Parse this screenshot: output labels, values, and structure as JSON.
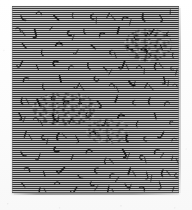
{
  "image": {
    "kind": "halftone-texture-plate",
    "caption": "",
    "title": "",
    "width_px": 192,
    "height_px": 210,
    "background_color": "#ffffff"
  },
  "plate": {
    "label": "textured plate",
    "left_px": 12,
    "top_px": 6,
    "width_px": 167,
    "height_px": 187,
    "base_gray": "#8f8f8f",
    "scanline_dark": "#161616",
    "scanline_light": "#e8e8e8",
    "scanline_period_px": 2,
    "edge_color": "#787878",
    "shadow_color": "#5a5a5a"
  },
  "texture": {
    "description": "mid-gray field of fine horizontal raster scanlines overlaid with scattered short dark curved strokes",
    "mark_color": "#141414",
    "highlight_color": "#f0f0f0",
    "mark_count": 168,
    "clusters": [
      {
        "name": "center-left-dense-cluster",
        "left_px": 20,
        "top_px": 86,
        "width_px": 66,
        "height_px": 34
      },
      {
        "name": "upper-right-dense-cluster",
        "left_px": 112,
        "top_px": 22,
        "width_px": 48,
        "height_px": 34
      },
      {
        "name": "mid-field-cluster",
        "left_px": 74,
        "top_px": 112,
        "width_px": 44,
        "height_px": 26
      }
    ],
    "marks": [
      {
        "x": 9,
        "y": 10,
        "r": -18,
        "s": 1.0,
        "t": "hook"
      },
      {
        "x": 27,
        "y": 8,
        "r": 12,
        "s": 0.9,
        "t": "arc"
      },
      {
        "x": 44,
        "y": 12,
        "r": -40,
        "s": 1.1,
        "t": "tick"
      },
      {
        "x": 61,
        "y": 7,
        "r": 25,
        "s": 0.8,
        "t": "hook"
      },
      {
        "x": 79,
        "y": 11,
        "r": -8,
        "s": 1.0,
        "t": "cee"
      },
      {
        "x": 96,
        "y": 9,
        "r": 35,
        "s": 0.9,
        "t": "tick"
      },
      {
        "x": 113,
        "y": 13,
        "r": -22,
        "s": 1.0,
        "t": "arc"
      },
      {
        "x": 131,
        "y": 8,
        "r": 16,
        "s": 1.1,
        "t": "hook"
      },
      {
        "x": 148,
        "y": 12,
        "r": -30,
        "s": 0.9,
        "t": "jay"
      },
      {
        "x": 158,
        "y": 6,
        "r": 8,
        "s": 0.8,
        "t": "tick"
      },
      {
        "x": 6,
        "y": 24,
        "r": 30,
        "s": 0.9,
        "t": "arc"
      },
      {
        "x": 22,
        "y": 27,
        "r": -14,
        "s": 1.1,
        "t": "jay"
      },
      {
        "x": 39,
        "y": 22,
        "r": 44,
        "s": 0.8,
        "t": "tick"
      },
      {
        "x": 56,
        "y": 28,
        "r": -26,
        "s": 1.0,
        "t": "cee"
      },
      {
        "x": 72,
        "y": 23,
        "r": 10,
        "s": 0.9,
        "t": "hook"
      },
      {
        "x": 90,
        "y": 29,
        "r": -36,
        "s": 1.0,
        "t": "arc"
      },
      {
        "x": 106,
        "y": 24,
        "r": 20,
        "s": 1.1,
        "t": "tick"
      },
      {
        "x": 122,
        "y": 30,
        "r": -12,
        "s": 0.9,
        "t": "hook"
      },
      {
        "x": 139,
        "y": 25,
        "r": 38,
        "s": 1.0,
        "t": "jay"
      },
      {
        "x": 155,
        "y": 29,
        "r": -20,
        "s": 0.9,
        "t": "cee"
      },
      {
        "x": 12,
        "y": 40,
        "r": -34,
        "s": 1.0,
        "t": "tick"
      },
      {
        "x": 30,
        "y": 44,
        "r": 18,
        "s": 0.9,
        "t": "hook"
      },
      {
        "x": 47,
        "y": 39,
        "r": -6,
        "s": 1.1,
        "t": "arc"
      },
      {
        "x": 64,
        "y": 45,
        "r": 28,
        "s": 0.8,
        "t": "jay"
      },
      {
        "x": 81,
        "y": 41,
        "r": -42,
        "s": 1.0,
        "t": "tick"
      },
      {
        "x": 98,
        "y": 46,
        "r": 14,
        "s": 0.9,
        "t": "cee"
      },
      {
        "x": 115,
        "y": 40,
        "r": -24,
        "s": 1.0,
        "t": "hook"
      },
      {
        "x": 132,
        "y": 45,
        "r": 32,
        "s": 1.1,
        "t": "arc"
      },
      {
        "x": 149,
        "y": 41,
        "r": -16,
        "s": 0.9,
        "t": "tick"
      },
      {
        "x": 161,
        "y": 47,
        "r": 22,
        "s": 0.8,
        "t": "hook"
      },
      {
        "x": 8,
        "y": 57,
        "r": 26,
        "s": 1.0,
        "t": "jay"
      },
      {
        "x": 25,
        "y": 61,
        "r": -18,
        "s": 0.9,
        "t": "tick"
      },
      {
        "x": 42,
        "y": 56,
        "r": 40,
        "s": 1.1,
        "t": "cee"
      },
      {
        "x": 59,
        "y": 62,
        "r": -28,
        "s": 0.9,
        "t": "arc"
      },
      {
        "x": 76,
        "y": 57,
        "r": 12,
        "s": 1.0,
        "t": "hook"
      },
      {
        "x": 93,
        "y": 63,
        "r": -38,
        "s": 0.9,
        "t": "tick"
      },
      {
        "x": 110,
        "y": 58,
        "r": 20,
        "s": 1.1,
        "t": "jay"
      },
      {
        "x": 127,
        "y": 62,
        "r": -10,
        "s": 0.9,
        "t": "arc"
      },
      {
        "x": 144,
        "y": 57,
        "r": 34,
        "s": 1.0,
        "t": "hook"
      },
      {
        "x": 159,
        "y": 63,
        "r": -22,
        "s": 0.8,
        "t": "cee"
      },
      {
        "x": 14,
        "y": 74,
        "r": -30,
        "s": 1.0,
        "t": "arc"
      },
      {
        "x": 31,
        "y": 78,
        "r": 16,
        "s": 0.9,
        "t": "hook"
      },
      {
        "x": 48,
        "y": 73,
        "r": -8,
        "s": 1.1,
        "t": "tick"
      },
      {
        "x": 65,
        "y": 79,
        "r": 30,
        "s": 0.9,
        "t": "jay"
      },
      {
        "x": 83,
        "y": 74,
        "r": -44,
        "s": 1.0,
        "t": "cee"
      },
      {
        "x": 100,
        "y": 80,
        "r": 18,
        "s": 0.9,
        "t": "arc"
      },
      {
        "x": 117,
        "y": 75,
        "r": -26,
        "s": 1.1,
        "t": "hook"
      },
      {
        "x": 134,
        "y": 79,
        "r": 36,
        "s": 0.9,
        "t": "tick"
      },
      {
        "x": 151,
        "y": 74,
        "r": -14,
        "s": 1.0,
        "t": "jay"
      },
      {
        "x": 163,
        "y": 80,
        "r": 24,
        "s": 0.8,
        "t": "arc"
      },
      {
        "x": 10,
        "y": 92,
        "r": 22,
        "s": 1.0,
        "t": "hook"
      },
      {
        "x": 26,
        "y": 96,
        "r": -16,
        "s": 1.1,
        "t": "tick"
      },
      {
        "x": 40,
        "y": 91,
        "r": 42,
        "s": 0.9,
        "t": "cee"
      },
      {
        "x": 54,
        "y": 97,
        "r": -30,
        "s": 1.0,
        "t": "arc"
      },
      {
        "x": 68,
        "y": 92,
        "r": 14,
        "s": 0.9,
        "t": "hook"
      },
      {
        "x": 86,
        "y": 98,
        "r": -40,
        "s": 1.0,
        "t": "jay"
      },
      {
        "x": 104,
        "y": 93,
        "r": 26,
        "s": 1.1,
        "t": "tick"
      },
      {
        "x": 121,
        "y": 97,
        "r": -12,
        "s": 0.9,
        "t": "cee"
      },
      {
        "x": 138,
        "y": 92,
        "r": 32,
        "s": 1.0,
        "t": "hook"
      },
      {
        "x": 155,
        "y": 98,
        "r": -24,
        "s": 0.9,
        "t": "arc"
      },
      {
        "x": 7,
        "y": 110,
        "r": -28,
        "s": 1.0,
        "t": "jay"
      },
      {
        "x": 24,
        "y": 114,
        "r": 20,
        "s": 0.9,
        "t": "arc"
      },
      {
        "x": 41,
        "y": 109,
        "r": -6,
        "s": 1.1,
        "t": "hook"
      },
      {
        "x": 58,
        "y": 115,
        "r": 34,
        "s": 0.9,
        "t": "tick"
      },
      {
        "x": 75,
        "y": 110,
        "r": -42,
        "s": 1.0,
        "t": "cee"
      },
      {
        "x": 92,
        "y": 116,
        "r": 16,
        "s": 0.9,
        "t": "jay"
      },
      {
        "x": 109,
        "y": 111,
        "r": -20,
        "s": 1.1,
        "t": "arc"
      },
      {
        "x": 126,
        "y": 115,
        "r": 38,
        "s": 0.9,
        "t": "hook"
      },
      {
        "x": 143,
        "y": 110,
        "r": -10,
        "s": 1.0,
        "t": "tick"
      },
      {
        "x": 158,
        "y": 116,
        "r": 28,
        "s": 0.8,
        "t": "cee"
      },
      {
        "x": 13,
        "y": 128,
        "r": 24,
        "s": 1.0,
        "t": "tick"
      },
      {
        "x": 30,
        "y": 132,
        "r": -18,
        "s": 0.9,
        "t": "cee"
      },
      {
        "x": 47,
        "y": 127,
        "r": 40,
        "s": 1.1,
        "t": "hook"
      },
      {
        "x": 64,
        "y": 133,
        "r": -32,
        "s": 0.9,
        "t": "jay"
      },
      {
        "x": 81,
        "y": 128,
        "r": 12,
        "s": 1.0,
        "t": "arc"
      },
      {
        "x": 98,
        "y": 134,
        "r": -36,
        "s": 0.9,
        "t": "tick"
      },
      {
        "x": 115,
        "y": 129,
        "r": 22,
        "s": 1.1,
        "t": "hook"
      },
      {
        "x": 132,
        "y": 133,
        "r": -8,
        "s": 0.9,
        "t": "cee"
      },
      {
        "x": 149,
        "y": 128,
        "r": 30,
        "s": 1.0,
        "t": "jay"
      },
      {
        "x": 162,
        "y": 134,
        "r": -26,
        "s": 0.8,
        "t": "arc"
      },
      {
        "x": 9,
        "y": 146,
        "r": -22,
        "s": 1.0,
        "t": "hook"
      },
      {
        "x": 26,
        "y": 150,
        "r": 18,
        "s": 0.9,
        "t": "jay"
      },
      {
        "x": 43,
        "y": 145,
        "r": -44,
        "s": 1.1,
        "t": "cee"
      },
      {
        "x": 60,
        "y": 151,
        "r": 26,
        "s": 0.9,
        "t": "tick"
      },
      {
        "x": 77,
        "y": 146,
        "r": -14,
        "s": 1.0,
        "t": "arc"
      },
      {
        "x": 94,
        "y": 152,
        "r": 36,
        "s": 0.9,
        "t": "hook"
      },
      {
        "x": 111,
        "y": 147,
        "r": -30,
        "s": 1.1,
        "t": "jay"
      },
      {
        "x": 128,
        "y": 151,
        "r": 10,
        "s": 0.9,
        "t": "cee"
      },
      {
        "x": 145,
        "y": 146,
        "r": -38,
        "s": 1.0,
        "t": "arc"
      },
      {
        "x": 160,
        "y": 152,
        "r": 20,
        "s": 0.8,
        "t": "tick"
      },
      {
        "x": 15,
        "y": 164,
        "r": 28,
        "s": 1.0,
        "t": "arc"
      },
      {
        "x": 32,
        "y": 168,
        "r": -12,
        "s": 0.9,
        "t": "tick"
      },
      {
        "x": 49,
        "y": 163,
        "r": 44,
        "s": 1.1,
        "t": "jay"
      },
      {
        "x": 66,
        "y": 169,
        "r": -26,
        "s": 0.9,
        "t": "hook"
      },
      {
        "x": 83,
        "y": 164,
        "r": 14,
        "s": 1.0,
        "t": "cee"
      },
      {
        "x": 100,
        "y": 170,
        "r": -40,
        "s": 0.9,
        "t": "arc"
      },
      {
        "x": 117,
        "y": 165,
        "r": 24,
        "s": 1.1,
        "t": "tick"
      },
      {
        "x": 134,
        "y": 169,
        "r": -16,
        "s": 0.9,
        "t": "jay"
      },
      {
        "x": 151,
        "y": 164,
        "r": 32,
        "s": 1.0,
        "t": "hook"
      },
      {
        "x": 163,
        "y": 170,
        "r": -20,
        "s": 0.8,
        "t": "cee"
      },
      {
        "x": 11,
        "y": 179,
        "r": -34,
        "s": 0.9,
        "t": "tick"
      },
      {
        "x": 28,
        "y": 182,
        "r": 22,
        "s": 1.0,
        "t": "hook"
      },
      {
        "x": 45,
        "y": 178,
        "r": -10,
        "s": 0.9,
        "t": "arc"
      },
      {
        "x": 62,
        "y": 183,
        "r": 30,
        "s": 1.0,
        "t": "jay"
      },
      {
        "x": 79,
        "y": 179,
        "r": -42,
        "s": 0.9,
        "t": "cee"
      },
      {
        "x": 96,
        "y": 183,
        "r": 18,
        "s": 1.0,
        "t": "tick"
      },
      {
        "x": 113,
        "y": 178,
        "r": -24,
        "s": 0.9,
        "t": "hook"
      },
      {
        "x": 130,
        "y": 183,
        "r": 38,
        "s": 1.0,
        "t": "arc"
      },
      {
        "x": 147,
        "y": 179,
        "r": -18,
        "s": 0.9,
        "t": "jay"
      },
      {
        "x": 161,
        "y": 183,
        "r": 26,
        "s": 0.8,
        "t": "tick"
      }
    ]
  }
}
